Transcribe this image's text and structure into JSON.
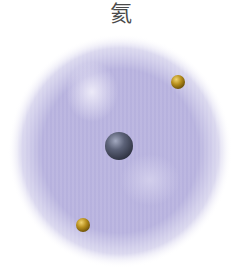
{
  "diagram": {
    "title": "氦",
    "colors": {
      "background": "#ffffff",
      "cloud": "#a9a3d6",
      "cloud_light": "#d6d2ee",
      "nucleus": "#4d5264",
      "nucleus_highlight": "#9aa0b8",
      "electron": "#b08a1e",
      "electron_highlight": "#e6c65a",
      "title": "#4a4a4a"
    },
    "electron_cloud": {
      "cx": 120,
      "cy": 151,
      "rx": 110,
      "ry": 115
    },
    "nucleus": {
      "cx": 119,
      "cy": 146,
      "r": 14
    },
    "electrons": [
      {
        "cx": 178,
        "cy": 82,
        "r": 7
      },
      {
        "cx": 83,
        "cy": 225,
        "r": 7
      }
    ]
  }
}
